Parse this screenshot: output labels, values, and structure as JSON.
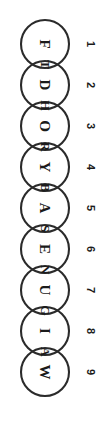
{
  "diagram": {
    "type": "overlapping-circle-word-chain",
    "orientation_degrees": 90,
    "background_color": "#ffffff",
    "stroke_color": "#2b2b2b",
    "text_color": "#1b1b1b",
    "circle_count": 9,
    "circles": [
      {
        "index": "1",
        "letter": "F"
      },
      {
        "index": "2",
        "letter": "D"
      },
      {
        "index": "3",
        "letter": "O"
      },
      {
        "index": "4",
        "letter": "Y"
      },
      {
        "index": "5",
        "letter": "A"
      },
      {
        "index": "6",
        "letter": "E"
      },
      {
        "index": "7",
        "letter": "U"
      },
      {
        "index": "8",
        "letter": "I"
      },
      {
        "index": "9",
        "letter": "W"
      }
    ],
    "overlaps": [
      {
        "between": "1-2",
        "letter": "T"
      },
      {
        "between": "2-3",
        "letter": "H"
      },
      {
        "between": "3-4",
        "letter": "R"
      },
      {
        "between": "4-5",
        "letter": "B"
      },
      {
        "between": "5-6",
        "letter": "S"
      },
      {
        "between": "6-7",
        "letter": "N"
      },
      {
        "between": "7-8",
        "letter": "G"
      },
      {
        "between": "8-9",
        "letter": "A"
      }
    ],
    "letter_sequence": "F T D H O R Y B A S E N U G I A W",
    "index_labels": [
      "1",
      "2",
      "3",
      "4",
      "5",
      "6",
      "7",
      "8",
      "9"
    ]
  }
}
